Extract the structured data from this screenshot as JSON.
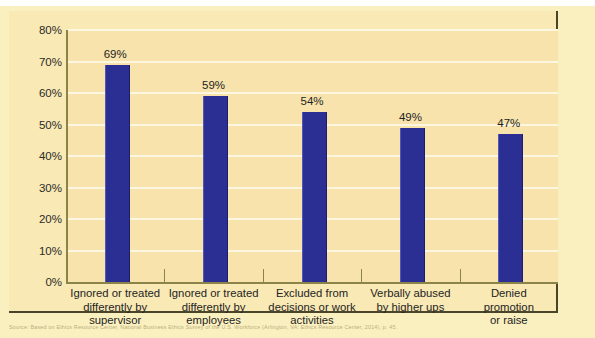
{
  "chart_data": {
    "type": "bar",
    "title": "",
    "subtitle": "",
    "xlabel": "",
    "ylabel": "",
    "ylim": [
      0,
      80
    ],
    "grid": true,
    "legend": "none",
    "orientation": "vertical",
    "categories": [
      "Ignored or treated differently by supervisor",
      "Ignored or treated differently by employees",
      "Excluded from decisions or work activities",
      "Verbally abused by higher ups",
      "Denied promotion or raise"
    ],
    "category_lines": [
      [
        "Ignored or treated",
        "differently by",
        "supervisor"
      ],
      [
        "Ignored or treated",
        "differently by",
        "employees"
      ],
      [
        "Excluded from",
        "decisions or work",
        "activities"
      ],
      [
        "Verbally abused",
        "by higher ups"
      ],
      [
        "Denied promotion",
        "or raise"
      ]
    ],
    "values": [
      69,
      59,
      54,
      49,
      47
    ],
    "value_labels": [
      "69%",
      "59%",
      "54%",
      "49%",
      "47%"
    ],
    "ytick_labels": [
      "80%",
      "70%",
      "60%",
      "50%",
      "40%",
      "30%",
      "20%",
      "10%",
      "0%"
    ],
    "ytick_values": [
      80,
      70,
      60,
      50,
      40,
      30,
      20,
      10,
      0
    ],
    "colors": {
      "bar": "#2b2f94",
      "plot_background": "#f8e3ac",
      "card_background": "#f9e9b4",
      "page_background": "#faf0bf",
      "gridline": "#fdf6e0",
      "axis": "#8a8448",
      "text": "#242424"
    }
  },
  "source_note": "Source: Based on Ethics Resource Center, National Business Ethics Survey of the U.S. Workforce (Arlington, VA: Ethics Resource Center, 2014), p. 45."
}
